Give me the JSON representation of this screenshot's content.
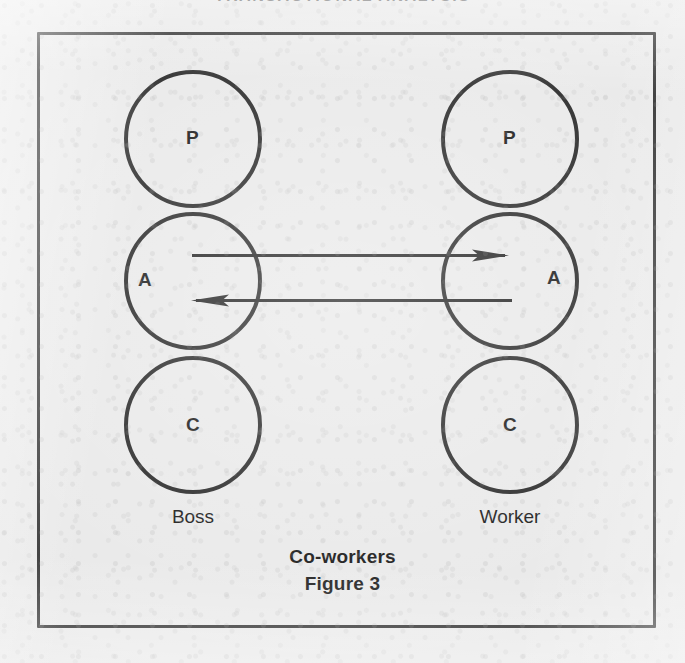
{
  "page": {
    "running_head": "TRANSACTIONAL ANALYSIS",
    "background_color": "#e9e9e9",
    "ink_color": "#232323"
  },
  "figure": {
    "caption_title": "Co-workers",
    "caption_figure_number": "Figure 3",
    "columns": [
      {
        "person": "Boss",
        "states": [
          {
            "code": "P",
            "name": "Parent"
          },
          {
            "code": "A",
            "name": "Adult"
          },
          {
            "code": "C",
            "name": "Child"
          }
        ]
      },
      {
        "person": "Worker",
        "states": [
          {
            "code": "P",
            "name": "Parent"
          },
          {
            "code": "A",
            "name": "Adult"
          },
          {
            "code": "C",
            "name": "Child"
          }
        ]
      }
    ],
    "transactions": [
      {
        "id": "stimulus",
        "from": "Boss.A",
        "to": "Worker.A",
        "direction": "left-to-right"
      },
      {
        "id": "response",
        "from": "Worker.A",
        "to": "Boss.A",
        "direction": "right-to-left"
      }
    ]
  }
}
